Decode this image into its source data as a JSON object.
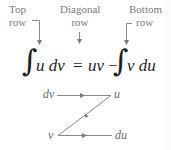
{
  "labels": {
    "top_row": {
      "line1": "Top",
      "line2": "row"
    },
    "diagonal_row": {
      "line1": "Diagonal",
      "line2": "row"
    },
    "bottom_row": {
      "line1": "Bottom",
      "line2": "row"
    }
  },
  "equation": {
    "integral_symbol": "∫",
    "lhs": "u dv",
    "equals": "=",
    "uv": "uv",
    "minus": "−",
    "rhs": "v du"
  },
  "diagram": {
    "top_left": "dv",
    "top_right": "u",
    "bottom_left": "v",
    "bottom_right": "du"
  },
  "colors": {
    "label": "#7a7a7a",
    "equation": "#1e1e1e",
    "diagram_line": "#8a8a8a"
  }
}
